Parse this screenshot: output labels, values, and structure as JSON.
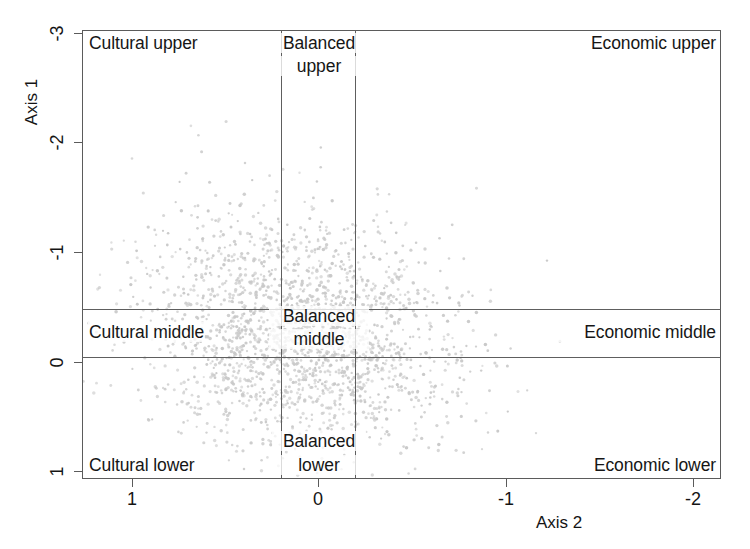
{
  "chart_data": {
    "type": "scatter",
    "title": "",
    "subtitle": "",
    "xlabel": "Axis 2",
    "ylabel": "Axis 1",
    "xlim": [
      1.27,
      -2.16
    ],
    "ylim": [
      1.08,
      -3.03
    ],
    "x_axis_inverted": true,
    "y_axis_inverted": true,
    "xticks": [
      1,
      0,
      -1,
      -2
    ],
    "xticklabels": [
      "1",
      "0",
      "-1",
      "-2"
    ],
    "yticks": [
      -3,
      -2,
      -1,
      0,
      1
    ],
    "yticklabels": [
      "-3",
      "-2",
      "-1",
      "0",
      "1"
    ],
    "grid": false,
    "legend_position": "none",
    "point_color": "#c9c9c9",
    "point_size": 2.0,
    "n_points": 2100,
    "cloud": {
      "center_x": 0.1,
      "center_y": -0.25,
      "spread_x": 0.42,
      "spread_y": 0.52,
      "description": "dense elliptical cloud of light gray points centred slightly right of Axis 2 = 0 and above Axis 1 = 0, thinning toward the corners"
    },
    "reference_lines": {
      "vertical": [
        0.2,
        -0.2
      ],
      "horizontal": [
        -0.48,
        -0.05
      ]
    },
    "regions": [
      {
        "id": "cultural-upper",
        "label": "Cultural upper",
        "x_band": "left",
        "y_band": "upper"
      },
      {
        "id": "balanced-upper",
        "label": "Balanced\nupper",
        "x_band": "center",
        "y_band": "upper"
      },
      {
        "id": "economic-upper",
        "label": "Economic upper",
        "x_band": "right",
        "y_band": "upper"
      },
      {
        "id": "cultural-middle",
        "label": "Cultural middle",
        "x_band": "left",
        "y_band": "middle"
      },
      {
        "id": "balanced-middle",
        "label": "Balanced\nmiddle",
        "x_band": "center",
        "y_band": "middle"
      },
      {
        "id": "economic-middle",
        "label": "Economic middle",
        "x_band": "right",
        "y_band": "middle"
      },
      {
        "id": "cultural-lower",
        "label": "Cultural lower",
        "x_band": "left",
        "y_band": "lower"
      },
      {
        "id": "balanced-lower",
        "label": "Balanced\nlower",
        "x_band": "center",
        "y_band": "lower"
      },
      {
        "id": "economic-lower",
        "label": "Economic lower",
        "x_band": "right",
        "y_band": "lower"
      }
    ]
  },
  "axes": {
    "x_title": "Axis 2",
    "y_title": "Axis 1",
    "x_ticklabels": [
      "1",
      "0",
      "-1",
      "-2"
    ],
    "y_ticklabels": [
      "-3",
      "-2",
      "-1",
      "0",
      "1"
    ]
  },
  "regions": {
    "cultural_upper": "Cultural upper",
    "balanced_upper_line1": "Balanced",
    "balanced_upper_line2": "upper",
    "economic_upper": "Economic upper",
    "cultural_middle": "Cultural middle",
    "balanced_middle_line1": "Balanced",
    "balanced_middle_line2": "middle",
    "economic_middle": "Economic middle",
    "cultural_lower": "Cultural lower",
    "balanced_lower_line1": "Balanced",
    "balanced_lower_line2": "lower",
    "economic_lower": "Economic lower"
  }
}
